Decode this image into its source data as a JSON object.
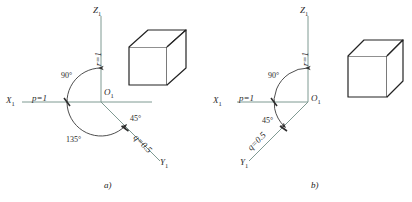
{
  "figure": {
    "title": "",
    "panels": [
      {
        "id": "a",
        "caption": "a)",
        "axes": {
          "z_label": "Z",
          "z_sub": "1",
          "x_label": "X",
          "x_sub": "1",
          "y_label": "Y",
          "y_sub": "1",
          "origin_label": "O",
          "origin_sub": "1"
        },
        "scale_labels": {
          "x_axis": "p=1",
          "z_axis": "r=1",
          "y_axis": "q=0.5"
        },
        "angles": [
          "90°",
          "135°",
          "45°"
        ],
        "cube": {
          "type": "oblique-cabinet-cube"
        }
      },
      {
        "id": "b",
        "caption": "b)",
        "axes": {
          "z_label": "Z",
          "z_sub": "1",
          "x_label": "X",
          "x_sub": "1",
          "y_label": "Y",
          "y_sub": "1",
          "origin_label": "O",
          "origin_sub": "1"
        },
        "scale_labels": {
          "x_axis": "p=1",
          "z_axis": "r=1",
          "y_axis": "q=0.5"
        },
        "angles": [
          "90°",
          "45°"
        ],
        "cube": {
          "type": "oblique-cabinet-cube"
        }
      }
    ],
    "colors": {
      "axis": "#7f9a92",
      "arc": "#3a3a3a",
      "cube_stroke": "#232323",
      "text": "#2b2b2b",
      "background": "#ffffff"
    }
  }
}
